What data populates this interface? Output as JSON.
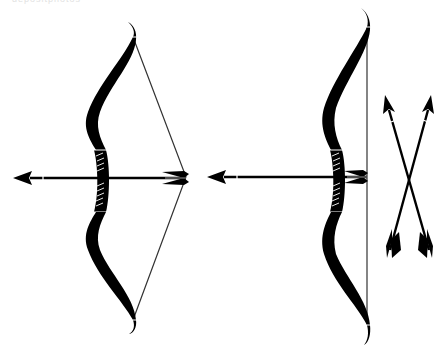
{
  "image": {
    "width": 442,
    "height": 349,
    "background": "#ffffff",
    "ink_color": "#000000",
    "string_color": "#333333",
    "description": "Black silhouette illustration of two recurve bows with arrows and a pair of crossed arrows"
  },
  "watermark": {
    "text": "depositphotos"
  },
  "figures": [
    {
      "name": "drawn-bow",
      "label": "Bow drawn with nocked arrow"
    },
    {
      "name": "strung-bow",
      "label": "Strung bow with nocked arrow"
    },
    {
      "name": "crossed-arrows",
      "label": "Two crossed arrows"
    }
  ]
}
